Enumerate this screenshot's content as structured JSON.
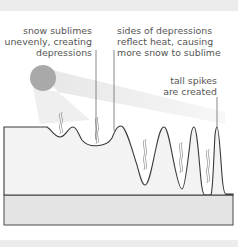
{
  "diagram": {
    "labels": {
      "depressions": {
        "line1": "snow sublimes",
        "line2": "unevenly, creating",
        "line3": "depressions"
      },
      "reflect": {
        "line1": "sides of depressions",
        "line2": "reflect heat, causing",
        "line3": "more snow to sublime"
      },
      "spikes": {
        "line1": "tall spikes",
        "line2": "are created"
      }
    },
    "colors": {
      "sun": "#a9a9a9",
      "beam": "#ececec",
      "snow": "#f3f3f3",
      "ground": "#e4e4e4",
      "outline": "#3a3a3a",
      "text": "#555555"
    },
    "elements": [
      "sun",
      "sun-beam",
      "snow-surface",
      "ground-layer",
      "vapor-wisps",
      "leader-lines"
    ]
  }
}
